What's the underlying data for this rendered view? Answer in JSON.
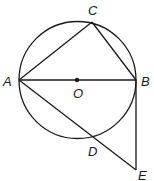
{
  "diagram": {
    "type": "geometry",
    "points": {
      "A": {
        "label": "A",
        "x": 19,
        "y": 80
      },
      "B": {
        "label": "B",
        "x": 136,
        "y": 80
      },
      "C": {
        "label": "C",
        "x": 92,
        "y": 22
      },
      "O": {
        "label": "O",
        "x": 77,
        "y": 80
      },
      "D": {
        "label": "D",
        "x": 96,
        "y": 139
      },
      "E": {
        "label": "E",
        "x": 136,
        "y": 170
      }
    },
    "circle": {
      "center": "O",
      "radius": 59
    },
    "segments": [
      "AB",
      "AC",
      "CB",
      "AE",
      "BE"
    ],
    "colors": {
      "stroke": "#1a1a1a",
      "background": "#ffffff"
    }
  }
}
